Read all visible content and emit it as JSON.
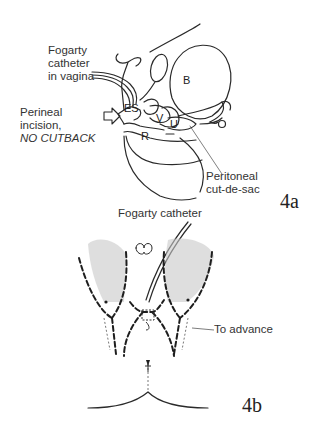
{
  "figure_4a": {
    "panel_label": "4a",
    "labels": {
      "catheter_line1": "Fogarty",
      "catheter_line2": "catheter",
      "catheter_line3": "in vagina",
      "incision_line1": "Perineal",
      "incision_line2": "incision,",
      "incision_line3": "NO CUTBACK",
      "cutdesac_line1": "Peritoneal",
      "cutdesac_line2": "cut-de-sac"
    },
    "organs": {
      "bladder": "B",
      "external_sphincter": "ES",
      "vagina": "V",
      "uterus": "U",
      "rectum": "R"
    }
  },
  "figure_4b": {
    "panel_label": "4b",
    "labels": {
      "catheter": "Fogarty catheter",
      "advance": "To advance"
    }
  },
  "colors": {
    "line": "#2a2a2a",
    "stipple": "#bdbdbd",
    "background": "#ffffff"
  }
}
